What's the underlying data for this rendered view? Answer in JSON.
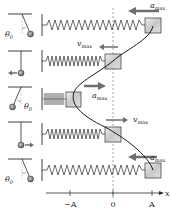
{
  "colors": {
    "ink": "#2a2a2a",
    "arrow": "#6e6e6e",
    "block_fill": "#d8d8d8",
    "dashed": "#8a8a8a"
  },
  "axis": {
    "label": "x",
    "ticks": [
      {
        "label": "−A",
        "x": 70
      },
      {
        "label": "0",
        "x": 113
      },
      {
        "label": "A",
        "x": 152
      }
    ]
  },
  "rows": [
    {
      "pendulum": {
        "state": "displaced-right",
        "angle_label": "θ0",
        "arrow": "none"
      },
      "block": {
        "position": "A",
        "vector": "a_max",
        "vector_direction": "left"
      }
    },
    {
      "pendulum": {
        "state": "vertical",
        "angle_label": "",
        "arrow": "left"
      },
      "block": {
        "position": "0",
        "vector": "v_max",
        "vector_direction": "left"
      }
    },
    {
      "pendulum": {
        "state": "displaced-left",
        "angle_label": "θ0",
        "arrow": "none"
      },
      "block": {
        "position": "−A",
        "vector": "a_max",
        "vector_direction": "right"
      }
    },
    {
      "pendulum": {
        "state": "vertical",
        "angle_label": "",
        "arrow": "right"
      },
      "block": {
        "position": "0",
        "vector": "v_max",
        "vector_direction": "right"
      }
    },
    {
      "pendulum": {
        "state": "displaced-right",
        "angle_label": "θ0",
        "arrow": "none"
      },
      "block": {
        "position": "A",
        "vector": "a_max",
        "vector_direction": "left"
      }
    }
  ],
  "labels": {
    "theta": "θ",
    "theta_sub": "0",
    "a": "a",
    "v": "v",
    "max": "max",
    "neg_A": "−A",
    "zero": "0",
    "A": "A",
    "x": "x"
  }
}
